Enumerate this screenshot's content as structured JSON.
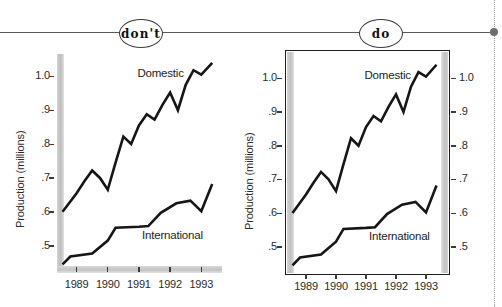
{
  "figure": {
    "header": {
      "dont_label": "don't",
      "do_label": "do"
    },
    "edge_marker": "dot-marker"
  },
  "chart_data": [
    {
      "id": "dont",
      "panel_label": "don't",
      "type": "line",
      "title": "",
      "xlabel": "",
      "ylabel": "Production (millions)",
      "ylim": [
        0.44,
        1.06
      ],
      "yticks": [
        0.5,
        0.6,
        0.7,
        0.8,
        0.9,
        1.0
      ],
      "ytick_labels": [
        ".5",
        ".6",
        ".7",
        ".8",
        ".9",
        "1.0"
      ],
      "xlim": [
        1988.5,
        1993.6
      ],
      "xticks": [
        1989,
        1990,
        1991,
        1992,
        1993
      ],
      "xtick_labels": [
        "1989",
        "1990",
        "1991",
        "1992",
        "1993"
      ],
      "grid": false,
      "frame": "open-grey-spines",
      "right_axis": false,
      "legend": "inline-labels",
      "series": [
        {
          "name": "Domestic",
          "label_pos": [
            1990.95,
            1.005
          ],
          "x": [
            1988.55,
            1989.0,
            1989.25,
            1989.5,
            1989.75,
            1990.0,
            1990.25,
            1990.5,
            1990.75,
            1991.0,
            1991.25,
            1991.5,
            1991.75,
            1992.0,
            1992.25,
            1992.5,
            1992.75,
            1993.0,
            1993.35
          ],
          "values": [
            0.6,
            0.655,
            0.69,
            0.722,
            0.7,
            0.665,
            0.745,
            0.822,
            0.8,
            0.855,
            0.888,
            0.872,
            0.915,
            0.952,
            0.9,
            0.975,
            1.018,
            1.005,
            1.04
          ]
        },
        {
          "name": "International",
          "label_pos": [
            1991.1,
            0.525
          ],
          "x": [
            1988.55,
            1988.8,
            1989.5,
            1990.0,
            1990.25,
            1991.0,
            1991.3,
            1991.7,
            1992.2,
            1992.65,
            1993.0,
            1993.35
          ],
          "values": [
            0.445,
            0.468,
            0.477,
            0.515,
            0.553,
            0.556,
            0.558,
            0.597,
            0.625,
            0.633,
            0.602,
            0.682
          ]
        }
      ]
    },
    {
      "id": "do",
      "panel_label": "do",
      "type": "line",
      "title": "",
      "xlabel": "",
      "ylabel": "Production (millions)",
      "ylim": [
        0.44,
        1.06
      ],
      "yticks": [
        0.5,
        0.6,
        0.7,
        0.8,
        0.9,
        1.0
      ],
      "ytick_labels": [
        ".5",
        ".6",
        ".7",
        ".8",
        ".9",
        "1.0"
      ],
      "ytick_labels_right": [
        ".5",
        ".6",
        ".7",
        ".8",
        ".9",
        "1.0"
      ],
      "xlim": [
        1988.5,
        1993.6
      ],
      "xticks": [
        1989,
        1990,
        1991,
        1992,
        1993
      ],
      "xtick_labels": [
        "1989",
        "1990",
        "1991",
        "1992",
        "1993"
      ],
      "grid": false,
      "frame": "closed-black-box",
      "right_axis": true,
      "legend": "inline-labels",
      "series": [
        {
          "name": "Domestic",
          "label_pos": [
            1990.95,
            1.005
          ],
          "x": [
            1988.55,
            1989.0,
            1989.25,
            1989.5,
            1989.75,
            1990.0,
            1990.25,
            1990.5,
            1990.75,
            1991.0,
            1991.25,
            1991.5,
            1991.75,
            1992.0,
            1992.25,
            1992.5,
            1992.75,
            1993.0,
            1993.35
          ],
          "values": [
            0.6,
            0.655,
            0.69,
            0.722,
            0.7,
            0.665,
            0.745,
            0.822,
            0.8,
            0.855,
            0.888,
            0.872,
            0.915,
            0.952,
            0.9,
            0.975,
            1.018,
            1.005,
            1.04
          ]
        },
        {
          "name": "International",
          "label_pos": [
            1991.1,
            0.525
          ],
          "x": [
            1988.55,
            1988.8,
            1989.5,
            1990.0,
            1990.25,
            1991.0,
            1991.3,
            1991.7,
            1992.2,
            1992.65,
            1993.0,
            1993.35
          ],
          "values": [
            0.445,
            0.468,
            0.477,
            0.515,
            0.553,
            0.556,
            0.558,
            0.597,
            0.625,
            0.633,
            0.602,
            0.682
          ]
        }
      ]
    }
  ],
  "colors": {
    "line": "#161616",
    "spine_grey": "#c3c3c3",
    "frame_black": "#1d1d1d",
    "rule_grey": "#5a5a5a",
    "text": "#2b2b2b"
  }
}
